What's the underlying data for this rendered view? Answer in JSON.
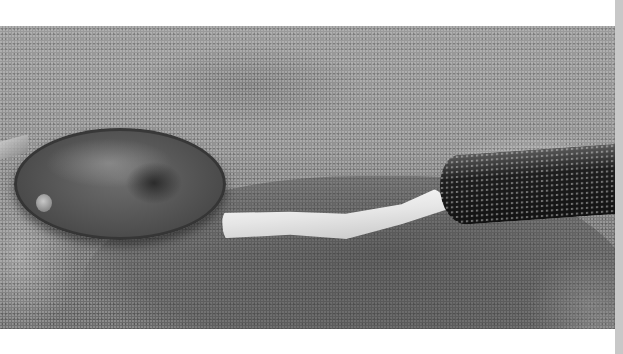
{
  "image": {
    "subject": "razor clam on wet sand with extended siphon and sand-encrusted tube",
    "alt": "Razor clam shell lying on sand with its pale siphon extending toward a dark sand tube"
  },
  "colors": {
    "background": "#ffffff",
    "scrollbar": "#c8c8c8",
    "sand": "#929292",
    "siphon": "#ececec",
    "tube": "#1a1a1a"
  }
}
